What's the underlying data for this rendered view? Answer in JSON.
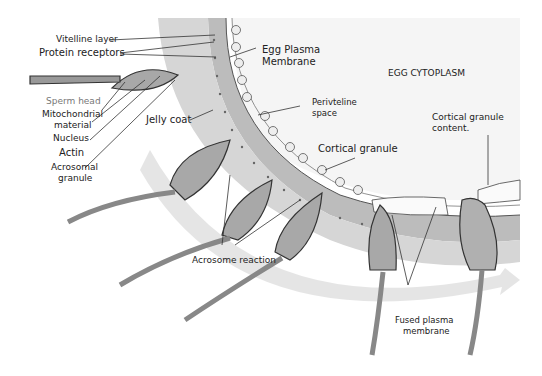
{
  "figure": {
    "colors": {
      "jelly_coat": "#b9b9b9",
      "vitelline_layer": "#9a9a9a",
      "perivitelline_space": "#ffffff",
      "egg_cytoplasm": "#f4f4f4",
      "arrow_band": "#e3e3e3",
      "outline": "#333333",
      "sperm_body": "#a8a8a8"
    }
  },
  "labels": {
    "vitelline_layer": "Vitelline layer",
    "protein_receptors": "Protein receptors",
    "egg_plasma_membrane_1": "Egg Plasma",
    "egg_plasma_membrane_2": "Membrane",
    "egg_cytoplasm": "EGG CYTOPLASM",
    "perivitelline_1": "Perivteline",
    "perivitelline_2": "space",
    "cortical_granule": "Cortical granule",
    "cortical_content_1": "Cortical granule",
    "cortical_content_2": "content.",
    "sperm_head": "Sperm head",
    "mitochondrial_1": "Mitochondrial",
    "mitochondrial_2": "material",
    "nucleus": "Nucleus",
    "actin": "Actin",
    "acrosomal_1": "Acrosomal",
    "acrosomal_2": "granule",
    "jelly_coat": "Jelly coat",
    "acrosome_reaction": "Acrosome reaction",
    "fused_1": "Fused plasma",
    "fused_2": "membrane"
  }
}
